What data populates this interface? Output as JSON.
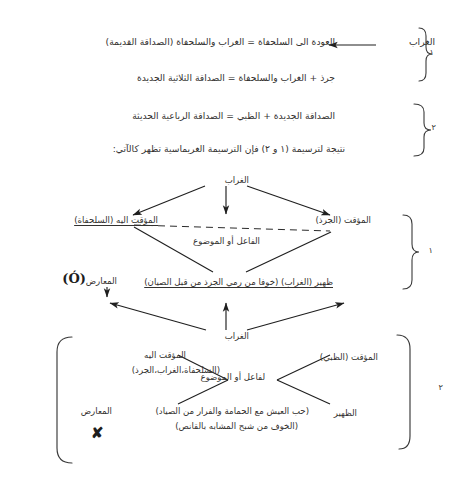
{
  "page": {
    "language": "Arabic",
    "background_color": "#ffffff",
    "ink_color": "#33312f",
    "width": 453,
    "height": 490
  },
  "equations": {
    "group_one_label": "١",
    "group_two_label": "٢",
    "line_1": "العودة الى السلحفاة = الغراب والسلحفاة (الصداقة القديمة)",
    "line_1_source": "الغراب",
    "line_2": "جرذ + الغراب والسلحفاة = الصداقة الثلاثية الجديدة",
    "line_3": "الصداقة الجديدة + الظبي = الصداقة الرباعية الحديثة",
    "line_4": "نتيجة لترسيمة (١ و ٢) فإن الترسيمة الغريماسية تظهر كالآتي:"
  },
  "diagram_one": {
    "bracket_label": "١",
    "top_node": "الغراب",
    "left_node": "المؤقت اليه (السلحفاة)",
    "right_node": "المؤقت (الجرذ)",
    "middle_axis_label": "الفاعل أو الموضوع",
    "bottom_line_right": "ظهير (الغراب) (خوفا من رمي الجرذ من قبل الصيان)",
    "bottom_line_left": "المعارض",
    "bottom_symbol": "(Ó)"
  },
  "diagram_two": {
    "bracket_label": "٢",
    "top_node": "الغراب",
    "left_node_title": "المؤقت اليه",
    "left_node_detail": "(السلحفاة،الغراب،الجرذ)",
    "right_node": "المؤقت (الظبي)",
    "middle_axis_label": "لفاعل أو الموضوع",
    "support_label": "الظهير",
    "support_detail_1": "(حب العيش مع الحمامة والفرار من الصياد)",
    "support_detail_2": "(الخوف من شبح المشابه بالقانص)",
    "opposer_label": "المعارض",
    "opposer_symbol": "✘"
  }
}
